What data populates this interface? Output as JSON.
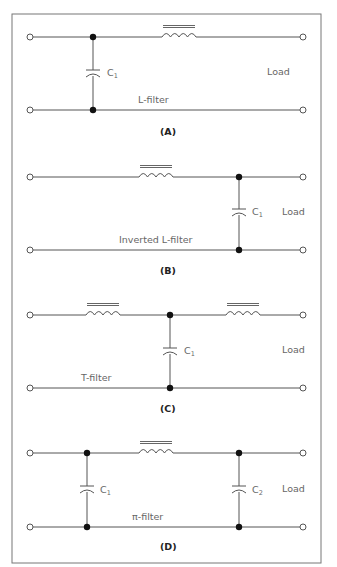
{
  "figure": {
    "panels": [
      {
        "id": "A",
        "caption": "(A)",
        "filter_name": "L-filter",
        "load_label": "Load",
        "capacitors": [
          {
            "label": "C",
            "subscript": "1"
          }
        ],
        "inductor_count": 1
      },
      {
        "id": "B",
        "caption": "(B)",
        "filter_name": "Inverted L-filter",
        "load_label": "Load",
        "capacitors": [
          {
            "label": "C",
            "subscript": "1"
          }
        ],
        "inductor_count": 1
      },
      {
        "id": "C",
        "caption": "(C)",
        "filter_name": "T-filter",
        "load_label": "Load",
        "capacitors": [
          {
            "label": "C",
            "subscript": "1"
          }
        ],
        "inductor_count": 2
      },
      {
        "id": "D",
        "caption": "(D)",
        "filter_name": "π-filter",
        "load_label": "Load",
        "capacitors": [
          {
            "label": "C",
            "subscript": "1"
          },
          {
            "label": "C",
            "subscript": "2"
          }
        ],
        "inductor_count": 1
      }
    ]
  },
  "colors": {
    "wire": "#555555",
    "junction": "#111111",
    "label": "#666666",
    "caption": "#222222",
    "frame": "#777777"
  }
}
